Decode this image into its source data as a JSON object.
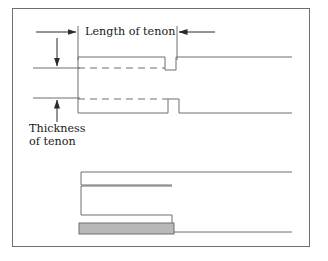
{
  "figure": {
    "kind": "technical-line-drawing",
    "border_color": "#6f6f6f",
    "background_color": "#ffffff",
    "line_color": "#6f6f6f",
    "text_color": "#1a1a1a",
    "fill_color": "#b8b8b8"
  },
  "annotations": {
    "length_of_tenon": "Length of tenon",
    "thickness_of_tenon_line1": "Thickness",
    "thickness_of_tenon_line2": "of tenon"
  },
  "dimension_lines": [
    {
      "name": "length-of-tenon-left-arrow",
      "orientation": "horizontal",
      "arrow_direction": "right",
      "from_x": 36,
      "to_x": 78,
      "y": 32
    },
    {
      "name": "length-of-tenon-right-arrow",
      "orientation": "horizontal",
      "arrow_direction": "left",
      "from_x": 214,
      "to_x": 177,
      "y": 32
    },
    {
      "name": "thickness-of-tenon-top-arrow",
      "orientation": "vertical",
      "arrow_direction": "down",
      "x": 57,
      "from_y": 38,
      "to_y": 68
    },
    {
      "name": "thickness-of-tenon-bottom-arrow",
      "orientation": "vertical",
      "arrow_direction": "up",
      "x": 57,
      "from_y": 120,
      "to_y": 98
    }
  ],
  "extension_lines": [
    {
      "name": "ext-left-vertical",
      "x": 78,
      "y1": 26,
      "y2": 60
    },
    {
      "name": "ext-right-vertical",
      "x": 177,
      "y1": 26,
      "y2": 60
    },
    {
      "name": "ext-upper-horizontal",
      "y": 68,
      "x1": 33,
      "x2": 78
    },
    {
      "name": "ext-lower-horizontal",
      "y": 98,
      "x1": 33,
      "x2": 78
    }
  ],
  "upper_view": {
    "name": "tenon-profile",
    "description": "stepped tenon outline with two notches and dashed centre lines",
    "top_profile_path": "M 78 57 L 165 57 L 165 70 L 176 70 L 176 57 L 292 57",
    "bottom_profile_path": "M 78 113 L 168 113 L 168 99 L 179 99 L 179 113 L 292 113",
    "left_edge": {
      "x": 78,
      "y1": 57,
      "y2": 113
    },
    "dashed_lines": [
      {
        "name": "upper-dashed-centreline",
        "y": 68,
        "x1": 78,
        "x2": 165
      },
      {
        "name": "lower-dashed-centreline",
        "y": 99,
        "x1": 78,
        "x2": 168
      }
    ]
  },
  "lower_view": {
    "name": "mortise-assembly",
    "description": "mortised member with inserted tenon shown shaded",
    "upper_rail_path": "M 292 172 L 81 172 L 81 185 L 172 185",
    "mortise_body_path": "M 172 185 L 81 185 L 81 187 L 81 215 L 172 215 L 172 232 L 292 232",
    "step_riser": {
      "x": 172,
      "y1": 185,
      "y2": 232
    },
    "shaded_tenon": {
      "x": 79,
      "y": 223,
      "width": 95,
      "height": 11
    }
  }
}
